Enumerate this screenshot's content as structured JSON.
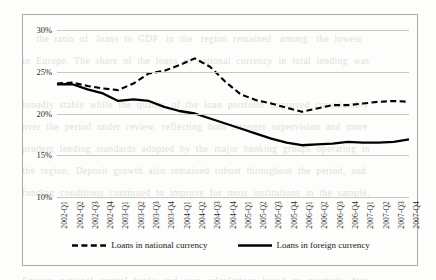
{
  "background_text": {
    "lines": [
      "                                                                                                  ",
      "        the  ratio  of   loans  to  GDP   in  the   region  remained   among   the  lowest",
      "   in  Europe.  The  share  of  the  loans  in  national  currency  in  total  lending  was",
      "                                                                                                  ",
      "   broadly  stable  while  the  quality  of  the  loan  portfolio  improved  considerably",
      "   over  the  period  under  review,  reflecting  both  stronger  supervision  and  more",
      "   prudent  lending  standards  adopted  by  the  major  banking  groups  operating  in",
      "   the  region.  Deposit  growth  also  remained  robust  throughout  the  period,  and",
      "   funding  conditions  continued  to  improve  for  most  institutions  in  the  sample.",
      "                                                                                                  ",
      "                                                                                                  ",
      "                                                                                                  ",
      "   Source:  national  central  banks  and  own  calculations  based  on  quarterly  data."
    ]
  },
  "chart_data": {
    "type": "line",
    "title": "",
    "xlabel": "",
    "ylabel": "",
    "ylim": [
      10,
      30
    ],
    "yticks": [
      10,
      15,
      20,
      25,
      30
    ],
    "ytick_labels": [
      "10%",
      "15%",
      "20%",
      "25%",
      "30%"
    ],
    "grid": true,
    "legend_position": "bottom",
    "categories": [
      "2002-Q1",
      "2002-Q2",
      "2002-Q3",
      "2002-Q4",
      "2003-Q1",
      "2003-Q2",
      "2003-Q3",
      "2003-Q4",
      "2004-Q1",
      "2004-Q2",
      "2004-Q3",
      "2004-Q4",
      "2005-Q1",
      "2005-Q2",
      "2005-Q3",
      "2005-Q4",
      "2006-Q1",
      "2006-Q2",
      "2006-Q3",
      "2006-Q4",
      "2007-Q1",
      "2007-Q2",
      "2007-Q3",
      "2007-Q4"
    ],
    "series": [
      {
        "name": "Loans in national currency",
        "style": "dashed",
        "color": "#000000",
        "values": [
          23.6,
          23.7,
          23.3,
          23.0,
          22.8,
          23.6,
          24.8,
          25.1,
          25.8,
          26.6,
          25.6,
          23.8,
          22.3,
          21.6,
          21.2,
          20.7,
          20.2,
          20.6,
          21.0,
          21.0,
          21.2,
          21.4,
          21.5,
          21.4
        ]
      },
      {
        "name": "Loans in foreign currency",
        "style": "solid",
        "color": "#000000",
        "values": [
          23.5,
          23.5,
          22.9,
          22.4,
          21.5,
          21.7,
          21.5,
          20.8,
          20.3,
          20.0,
          19.4,
          18.8,
          18.2,
          17.6,
          17.0,
          16.5,
          16.2,
          16.3,
          16.4,
          16.6,
          16.5,
          16.5,
          16.6,
          16.9
        ]
      }
    ]
  },
  "legend": {
    "items": [
      {
        "label": "Loans in national currency",
        "style": "dashed"
      },
      {
        "label": "Loans in foreign currency",
        "style": "solid"
      }
    ]
  }
}
